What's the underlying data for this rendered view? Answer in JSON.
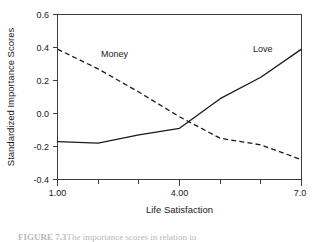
{
  "chart_data": {
    "type": "line",
    "title": "",
    "xlabel": "Life Satisfaction",
    "ylabel": "Standardized Importance Scores",
    "xlim": [
      1.0,
      7.0
    ],
    "ylim": [
      -0.4,
      0.6
    ],
    "grid": false,
    "legend": "inline-labels",
    "x_tick_labels": [
      "1.00",
      "4.00",
      "7.0"
    ],
    "x_tick_values": [
      1.0,
      4.0,
      7.0
    ],
    "x_minor_tick_values": [
      2.0,
      3.0,
      5.0,
      6.0
    ],
    "y_tick_labels": [
      "0.6",
      "0.4",
      "0.2",
      "0.0",
      "-0.2",
      "-0.4"
    ],
    "y_tick_values": [
      0.6,
      0.4,
      0.2,
      0.0,
      -0.2,
      -0.4
    ],
    "x": [
      1.0,
      2.0,
      3.0,
      4.0,
      5.0,
      6.0,
      7.0
    ],
    "series": [
      {
        "name": "Love",
        "style": "solid",
        "values": [
          -0.17,
          -0.18,
          -0.13,
          -0.09,
          0.09,
          0.22,
          0.39
        ]
      },
      {
        "name": "Money",
        "style": "dashed",
        "values": [
          0.39,
          0.27,
          0.13,
          -0.02,
          -0.15,
          -0.19,
          -0.28
        ]
      }
    ],
    "annotations": [
      {
        "text": "Money",
        "x": 2.4,
        "y": 0.345
      },
      {
        "text": "Love",
        "x": 6.05,
        "y": 0.375
      }
    ]
  },
  "caption": {
    "label": "FIGURE 7.3",
    "text": "The importance scores in relation to"
  }
}
